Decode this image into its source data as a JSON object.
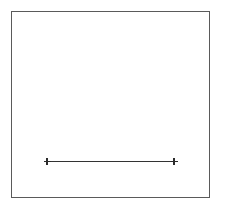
{
  "canvas": {
    "width": 226,
    "height": 211,
    "background": "#ffffff",
    "label": "geometric-line-diagram"
  },
  "frame": {
    "name": "bounding-rectangle",
    "x": 11.5,
    "y": 11.5,
    "width": 198,
    "height": 186,
    "stroke": "#5a5a5a",
    "stroke_width": 1.2,
    "fill": "#ffffff"
  },
  "segment": {
    "name": "horizontal-line-segment",
    "x1": 47,
    "y1": 161.5,
    "x2": 174,
    "y2": 161.5,
    "stroke": "#333333",
    "stroke_width": 1.6,
    "length_px": 127
  },
  "markers": [
    {
      "name": "left-endpoint-marker",
      "shape": "cross-marker",
      "cx": 47,
      "cy": 161.5,
      "size": 7,
      "stroke": "#2b2b2b",
      "stroke_width": 1.6
    },
    {
      "name": "right-endpoint-marker",
      "shape": "cross-marker",
      "cx": 174,
      "cy": 161.5,
      "size": 7,
      "stroke": "#2b2b2b",
      "stroke_width": 1.6
    }
  ],
  "chart_data": {
    "type": "line",
    "title": "",
    "subtitle": "",
    "xlabel": "",
    "ylabel": "",
    "grid": false,
    "legend": null,
    "annotations": [],
    "tick_labels": {
      "x": [],
      "y": []
    },
    "series": [
      {
        "name": "segment",
        "marker": "cross",
        "x": [
          47,
          174
        ],
        "y": [
          161.5,
          161.5
        ]
      }
    ],
    "axis_ranges": {
      "x": [
        11.5,
        209.5
      ],
      "y": [
        11.5,
        197.5
      ]
    }
  }
}
